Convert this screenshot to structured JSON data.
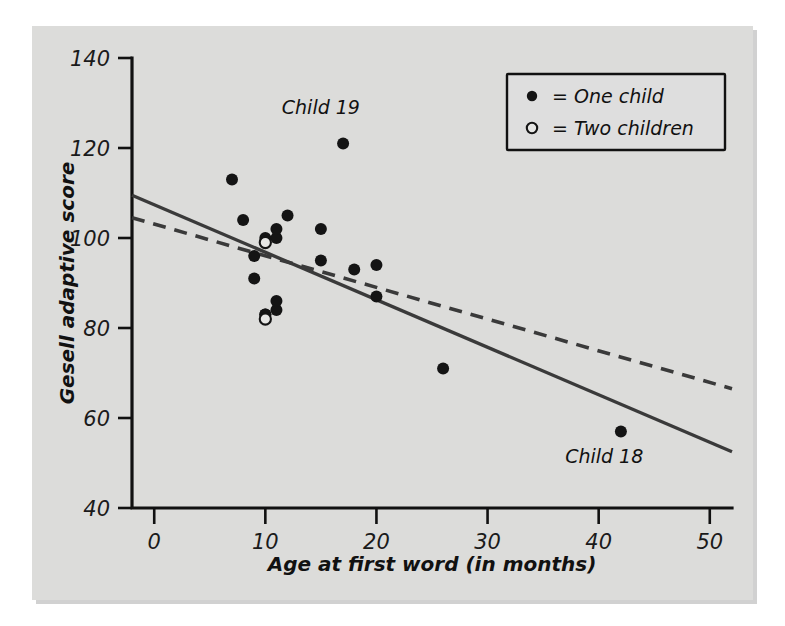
{
  "figure": {
    "background_color": "#d9d9d7",
    "plot_background_color": "#dcdcda"
  },
  "chart_data": {
    "type": "scatter",
    "title": "",
    "xlabel": "Age at first word (in months)",
    "ylabel": "Gesell adaptive score",
    "xlim": [
      -2,
      52
    ],
    "ylim": [
      40,
      140
    ],
    "xticks": [
      0,
      10,
      20,
      30,
      40,
      50
    ],
    "xtick_labels": [
      "0",
      "10",
      "20",
      "30",
      "40",
      "50"
    ],
    "yticks": [
      40,
      60,
      80,
      100,
      120,
      140
    ],
    "ytick_labels": [
      "40",
      "60",
      "80",
      "100",
      "120",
      "140"
    ],
    "grid": false,
    "legend_position": "top-right",
    "legend": [
      {
        "marker": "filled-circle",
        "label": "= One child"
      },
      {
        "marker": "open-circle",
        "label": "= Two children"
      }
    ],
    "series": [
      {
        "name": "One child",
        "marker": "filled-circle",
        "points": [
          {
            "x": 15,
            "y": 95
          },
          {
            "x": 26,
            "y": 71
          },
          {
            "x": 10,
            "y": 83
          },
          {
            "x": 9,
            "y": 91
          },
          {
            "x": 15,
            "y": 102
          },
          {
            "x": 20,
            "y": 87
          },
          {
            "x": 18,
            "y": 93
          },
          {
            "x": 11,
            "y": 100
          },
          {
            "x": 8,
            "y": 104
          },
          {
            "x": 20,
            "y": 94
          },
          {
            "x": 7,
            "y": 113
          },
          {
            "x": 9,
            "y": 96
          },
          {
            "x": 10,
            "y": 83
          },
          {
            "x": 11,
            "y": 84
          },
          {
            "x": 11,
            "y": 102
          },
          {
            "x": 10,
            "y": 100
          },
          {
            "x": 12,
            "y": 105
          },
          {
            "x": 42,
            "y": 57
          },
          {
            "x": 17,
            "y": 121
          },
          {
            "x": 11,
            "y": 86
          }
        ]
      },
      {
        "name": "Two children",
        "marker": "open-circle",
        "points": [
          {
            "x": 10,
            "y": 99
          },
          {
            "x": 10,
            "y": 82
          }
        ]
      }
    ],
    "fit_lines": [
      {
        "name": "all-data-regression",
        "style": "solid",
        "x0": -2,
        "y0": 109.5,
        "x1": 52,
        "y1": 52.5
      },
      {
        "name": "regression-without-child-18",
        "style": "dashed",
        "x0": -2,
        "y0": 104.5,
        "x1": 52,
        "y1": 66.5
      }
    ],
    "annotations": [
      {
        "text": "Child 19",
        "x": 15.0,
        "y": 127.5
      },
      {
        "text": "Child 18",
        "x": 40.5,
        "y": 50.0
      }
    ]
  }
}
